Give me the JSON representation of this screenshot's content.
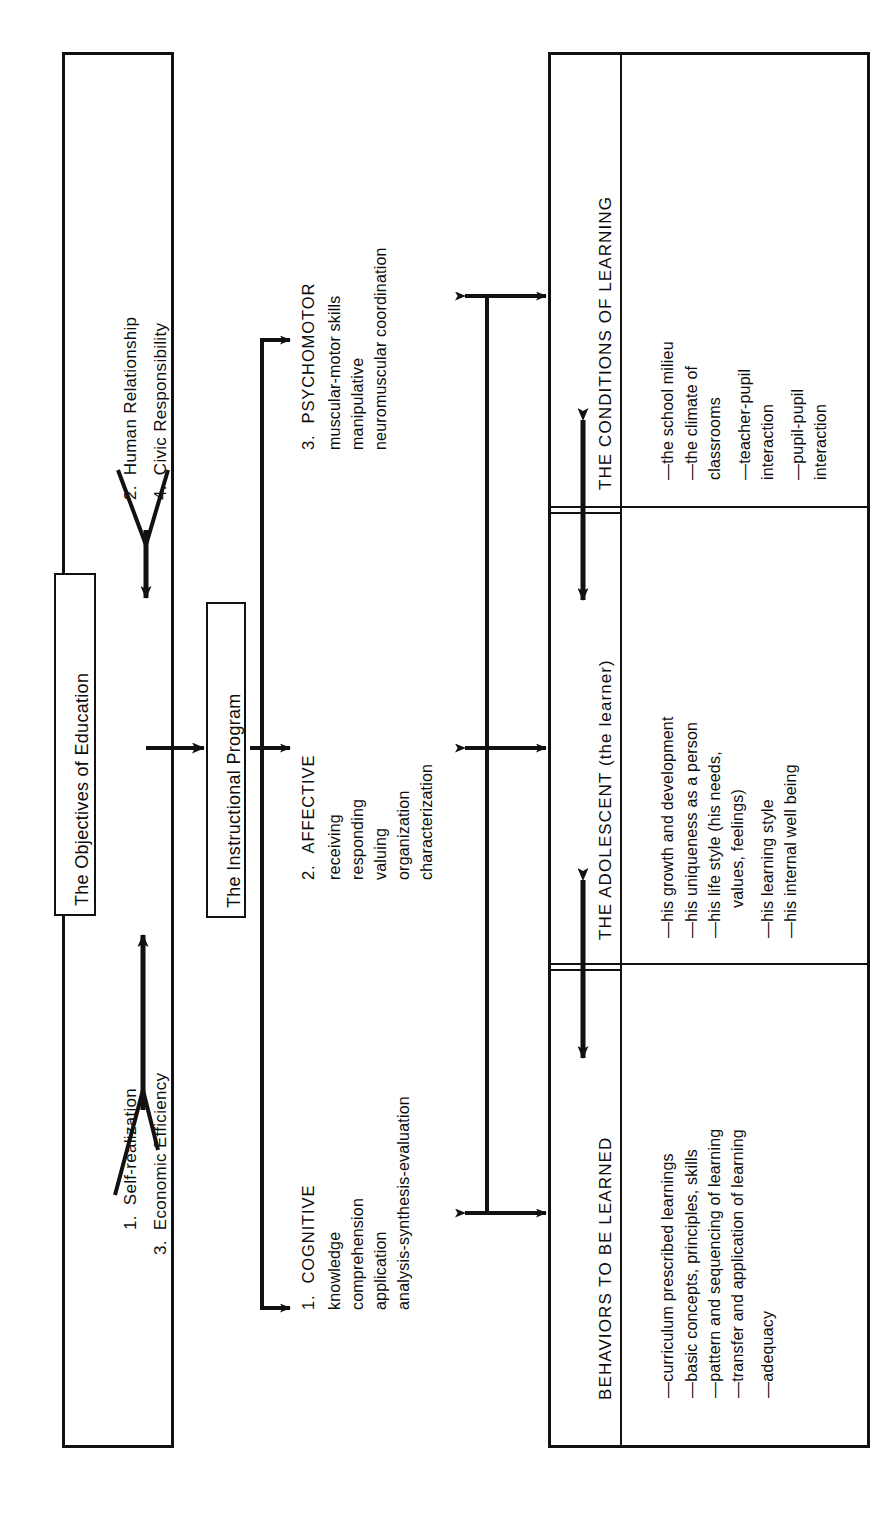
{
  "diagram": {
    "orientation": "rotated-90-ccw",
    "ink_color": "#111111",
    "background": "#ffffff"
  },
  "objectives_panel": {
    "label": "The Objectives of Education",
    "upper_group": [
      {
        "number": "2.",
        "text": "Human Relationship"
      },
      {
        "number": "4.",
        "text": "Civic Responsibility"
      }
    ],
    "lower_group": [
      {
        "number": "1.",
        "text": "Self-realization"
      },
      {
        "number": "3.",
        "text": "Economic Efficiency"
      }
    ]
  },
  "instructional_program": {
    "label": "The Instructional Program",
    "domains": [
      {
        "number": "1.",
        "name": "COGNITIVE",
        "items": [
          "knowledge",
          "comprehension",
          "application",
          "analysis-synthesis-evaluation"
        ]
      },
      {
        "number": "2.",
        "name": "AFFECTIVE",
        "items": [
          "receiving",
          "responding",
          "valuing",
          "organization",
          "characterization"
        ]
      },
      {
        "number": "3.",
        "name": "PSYCHOMOTOR",
        "items": [
          "muscular-motor skills",
          "manipulative",
          "neuromuscular coordination"
        ]
      }
    ]
  },
  "right_panel": {
    "sections": [
      {
        "title": "BEHAVIORS TO BE LEARNED",
        "items": [
          "—curriculum prescribed learnings",
          "—basic concepts, principles, skills",
          "—pattern and sequencing of learning",
          "—transfer and application of learning",
          "—adequacy"
        ]
      },
      {
        "title": "THE ADOLESCENT (the learner)",
        "items": [
          "—his growth and development",
          "—his uniqueness as a person",
          "—his life style (his needs,",
          "values, feelings)",
          "—his learning style",
          "—his internal well being"
        ]
      },
      {
        "title": "THE CONDITIONS OF LEARNING",
        "items": [
          "—the school milieu",
          "—the climate of",
          "classrooms",
          "—teacher-pupil",
          "interaction",
          "—pupil-pupil",
          "interaction"
        ]
      }
    ]
  },
  "connectors": {
    "objectives_merge_arrow": "y-merge-arrow",
    "program_feed_arrow": "right-arrow",
    "domain_branch": "trunk-with-three-arrows",
    "spine_arrows": "double-headed-arrows",
    "section_dividers": "double-rule"
  }
}
